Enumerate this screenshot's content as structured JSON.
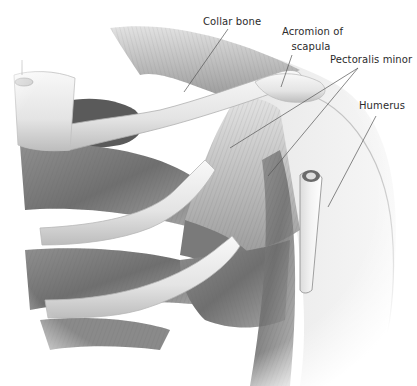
{
  "figure": {
    "palette": {
      "background": "#ffffff",
      "muscle_dark": "#6e6e6e",
      "muscle_mid": "#9a9a9a",
      "muscle_light": "#c9c9c9",
      "bone": "#ececec",
      "bone_shadow": "#b5b5b5",
      "cavity": "#4a4a4a",
      "label_text": "#2b2b2b",
      "leader_line": "#555555"
    },
    "labels": [
      {
        "id": "collar-bone",
        "text": "Collar bone",
        "x": 204,
        "y": 17,
        "leaders": [
          [
            228,
            29,
            184,
            92
          ]
        ]
      },
      {
        "id": "acromion",
        "text_line1": "Acromion of",
        "text_line2": "scapula",
        "x": 284,
        "y": 27,
        "leaders": [
          [
            292,
            55,
            281,
            87
          ]
        ]
      },
      {
        "id": "pectoralis-minor",
        "text": "Pectoralis minor",
        "x": 331,
        "y": 55,
        "leaders": [
          [
            358,
            68,
            230,
            148
          ],
          [
            358,
            68,
            268,
            176
          ]
        ]
      },
      {
        "id": "humerus",
        "text": "Humerus",
        "x": 360,
        "y": 101,
        "leaders": [
          [
            376,
            116,
            328,
            207
          ]
        ]
      }
    ]
  }
}
